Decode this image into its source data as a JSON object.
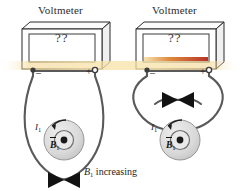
{
  "figure": {
    "caption_symbol": "B",
    "caption_subscript": "1",
    "caption_text": "increasing"
  },
  "meters": [
    {
      "id": "left",
      "label": "Voltmeter",
      "display_value": "??",
      "terminal_negative": "–",
      "terminal_positive": "+",
      "bar_visible": false
    },
    {
      "id": "right",
      "label": "Voltmeter",
      "display_value": "??",
      "terminal_negative": "–",
      "terminal_positive": "+",
      "bar_visible": true,
      "bar_color": "#c0392b"
    }
  ],
  "coils": [
    {
      "id": "left",
      "current_symbol": "I",
      "current_subscript": "1",
      "field_symbol": "B",
      "field_subscript": "1",
      "field_direction": "out-of-page",
      "loop_style": "untwisted"
    },
    {
      "id": "right",
      "current_symbol": "I",
      "current_subscript": "1",
      "field_symbol": "B",
      "field_subscript": "1",
      "field_direction": "out-of-page",
      "loop_style": "twisted"
    }
  ],
  "colors": {
    "wire": "#5a5a5a",
    "outline": "#2b2b2b",
    "coil_fill": "#d8d8d8",
    "glow": "#f5d98a",
    "bar": "#c0392b",
    "background": "#ffffff"
  }
}
